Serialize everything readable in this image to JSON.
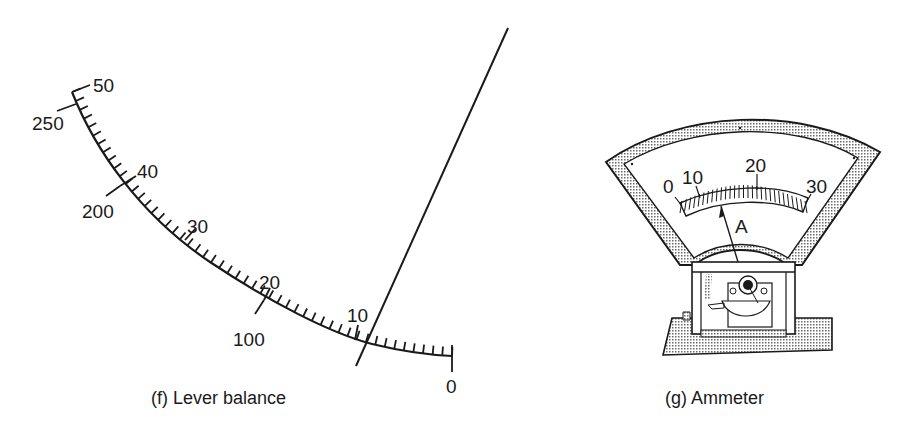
{
  "figure_f": {
    "caption": "(f)  Lever balance",
    "upper_scale_labels": [
      "50",
      "40",
      "30",
      "20",
      "10"
    ],
    "lower_scale_labels": [
      "250",
      "200",
      "100",
      "0"
    ]
  },
  "figure_g": {
    "caption": "(g)  Ammeter",
    "scale_labels": [
      "0",
      "10",
      "20",
      "30"
    ],
    "unit_label": "A"
  },
  "colors": {
    "ink": "#1a1a1a",
    "stipple": "#b8b8b8",
    "background": "#ffffff"
  }
}
